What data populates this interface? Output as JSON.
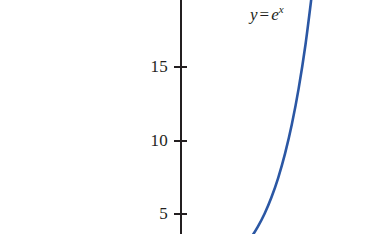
{
  "figure": {
    "background_color": "#ffffff",
    "axis_color": "#231f20",
    "curve_color": "#2b57a4"
  },
  "annotation": {
    "var_y": "y",
    "equals": "=",
    "base_e": "e",
    "exponent_x": "x",
    "full_text": "y = e^x"
  },
  "axis": {
    "ticks": [
      {
        "label": "20",
        "value": 20,
        "y_px": -8
      },
      {
        "label": "15",
        "value": 15,
        "y_px": 66
      },
      {
        "label": "10",
        "value": 10,
        "y_px": 140
      },
      {
        "label": "5",
        "value": 5,
        "y_px": 213
      }
    ]
  },
  "chart_data": {
    "type": "line",
    "title": "",
    "subtitle": "",
    "xlabel": "",
    "ylabel": "",
    "grid": false,
    "legend_position": "inline-annotation",
    "annotations": [
      {
        "text": "y = e^x",
        "x_px": 250,
        "y_px": 14
      }
    ],
    "y_tick_labels": [
      "20",
      "15",
      "10",
      "5"
    ],
    "y_ticks": [
      20,
      15,
      10,
      5
    ],
    "x_tick_labels": [],
    "ylim": [
      2.4,
      20.5
    ],
    "xlim": [
      0.88,
      3.02
    ],
    "series": [
      {
        "name": "y = e^x",
        "color": "#2b57a4",
        "x": [
          0.88,
          1.0,
          1.2,
          1.4,
          1.6,
          1.8,
          2.0,
          2.2,
          2.4,
          2.6,
          2.8,
          3.0
        ],
        "y": [
          2.41,
          2.72,
          3.32,
          4.06,
          4.95,
          6.05,
          7.39,
          9.03,
          11.02,
          13.46,
          16.44,
          20.09
        ]
      }
    ]
  }
}
